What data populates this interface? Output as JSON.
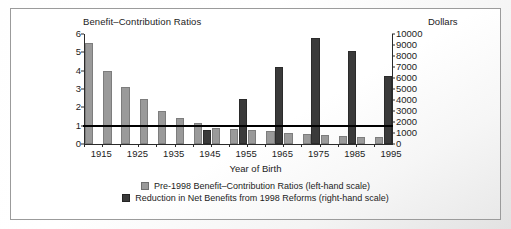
{
  "chart_data": {
    "type": "bar",
    "title": "",
    "xlabel": "Year of Birth",
    "ylabel": "Benefit–Contribution Ratios",
    "ylabel_right": "Dollars",
    "grid": false,
    "legend_position": "bottom",
    "categories": [
      "1915",
      "1920",
      "1925",
      "1930",
      "1935",
      "1940",
      "1945",
      "1950",
      "1955",
      "1960",
      "1965",
      "1970",
      "1975",
      "1980",
      "1985",
      "1990",
      "1995"
    ],
    "tick_labels_x": [
      "1915",
      "1925",
      "1935",
      "1945",
      "1955",
      "1965",
      "1975",
      "1985",
      "1995"
    ],
    "ylim": [
      0,
      6
    ],
    "yticks": [
      "0",
      "1",
      "2",
      "3",
      "4",
      "5",
      "6"
    ],
    "ylim_right": [
      0,
      10000
    ],
    "yticks_right": [
      "0",
      "1000",
      "2000",
      "3000",
      "4000",
      "5000",
      "6000",
      "7000",
      "8000",
      "9000",
      "10000"
    ],
    "reference_line": {
      "left_value": 1,
      "right_value": 2000,
      "color": "#000000"
    },
    "series": [
      {
        "name": "Pre-1998 Benefit–Contribution Ratios (left-hand scale)",
        "axis": "left",
        "color": "#9a9a9a",
        "values": [
          5.52,
          3.98,
          3.1,
          2.45,
          1.82,
          1.42,
          1.12,
          0.86,
          0.84,
          0.78,
          0.7,
          0.6,
          0.55,
          0.5,
          0.45,
          0.4,
          0.38
        ]
      },
      {
        "name": "Reduction in Net Benefits from 1998 Reforms (right-hand scale)",
        "axis": "right",
        "color": "#3a3a3a",
        "values": [
          0,
          0,
          0,
          0,
          0,
          0,
          1250,
          0,
          4100,
          0,
          7000,
          0,
          9600,
          0,
          8500,
          0,
          6200
        ]
      }
    ]
  },
  "legend": [
    {
      "label": "Pre-1998 Benefit–Contribution Ratios (left-hand scale)",
      "swatch": "light"
    },
    {
      "label": "Reduction in Net Benefits from 1998 Reforms (right-hand scale)",
      "swatch": "dark"
    }
  ]
}
